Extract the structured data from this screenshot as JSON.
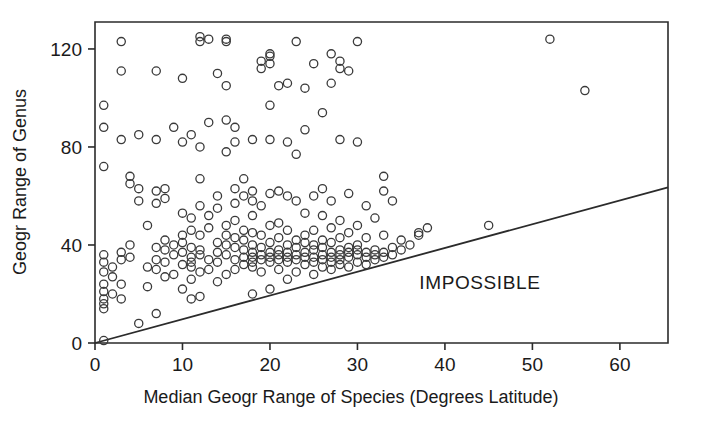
{
  "chart_data": {
    "type": "scatter",
    "title": "",
    "xlabel": "Median Geogr Range of Species (Degrees Latitude)",
    "ylabel": "Geogr Range of Genus",
    "xlim": [
      0,
      65.5
    ],
    "ylim": [
      0,
      131
    ],
    "xticks": [
      0,
      10,
      20,
      30,
      40,
      50,
      60
    ],
    "xtick_labels": [
      "0",
      "10",
      "20",
      "30",
      "40",
      "50",
      "60"
    ],
    "yticks": [
      0,
      40,
      80,
      120
    ],
    "ytick_labels": [
      "0",
      "40",
      "80",
      "120"
    ],
    "grid": false,
    "legend": null,
    "annotations": [
      {
        "text": "IMPOSSIBLE",
        "x": 44,
        "y": 22,
        "name": "impossible-region-label"
      }
    ],
    "reference_line": {
      "name": "identity-boundary-line",
      "description": "Lower bound: genus range cannot be less than median species range",
      "x0": 0,
      "y0": 0,
      "x1": 65.5,
      "y1": 63.5
    },
    "marker": {
      "shape": "open-circle",
      "size": 6,
      "edge_color": "#3a3a3a",
      "fill": "none"
    },
    "points": [
      [
        1,
        1
      ],
      [
        1,
        14
      ],
      [
        1,
        16
      ],
      [
        1,
        18
      ],
      [
        1,
        21
      ],
      [
        1,
        24
      ],
      [
        1,
        29
      ],
      [
        1,
        33
      ],
      [
        1,
        36
      ],
      [
        1,
        72
      ],
      [
        1,
        88
      ],
      [
        1,
        97
      ],
      [
        2,
        20
      ],
      [
        2,
        27
      ],
      [
        2,
        31
      ],
      [
        3,
        18
      ],
      [
        3,
        24
      ],
      [
        3,
        34
      ],
      [
        3,
        37
      ],
      [
        3,
        83
      ],
      [
        3,
        111
      ],
      [
        3,
        123
      ],
      [
        4,
        35
      ],
      [
        4,
        40
      ],
      [
        4,
        65
      ],
      [
        4,
        68
      ],
      [
        5,
        8
      ],
      [
        5,
        58
      ],
      [
        5,
        63
      ],
      [
        5,
        85
      ],
      [
        6,
        23
      ],
      [
        6,
        31
      ],
      [
        6,
        48
      ],
      [
        7,
        12
      ],
      [
        7,
        30
      ],
      [
        7,
        34
      ],
      [
        7,
        39
      ],
      [
        7,
        57
      ],
      [
        7,
        62
      ],
      [
        7,
        83
      ],
      [
        7,
        111
      ],
      [
        8,
        27
      ],
      [
        8,
        33
      ],
      [
        8,
        38
      ],
      [
        8,
        42
      ],
      [
        8,
        59
      ],
      [
        8,
        63
      ],
      [
        9,
        28
      ],
      [
        9,
        36
      ],
      [
        9,
        40
      ],
      [
        9,
        88
      ],
      [
        10,
        22
      ],
      [
        10,
        32
      ],
      [
        10,
        37
      ],
      [
        10,
        41
      ],
      [
        10,
        44
      ],
      [
        10,
        53
      ],
      [
        10,
        82
      ],
      [
        10,
        108
      ],
      [
        11,
        18
      ],
      [
        11,
        26
      ],
      [
        11,
        31
      ],
      [
        11,
        33
      ],
      [
        11,
        35
      ],
      [
        11,
        39
      ],
      [
        11,
        46
      ],
      [
        11,
        51
      ],
      [
        11,
        85
      ],
      [
        12,
        19
      ],
      [
        12,
        29
      ],
      [
        12,
        36
      ],
      [
        12,
        38
      ],
      [
        12,
        44
      ],
      [
        12,
        56
      ],
      [
        12,
        67
      ],
      [
        12,
        80
      ],
      [
        12,
        123
      ],
      [
        12,
        125
      ],
      [
        13,
        30
      ],
      [
        13,
        34
      ],
      [
        13,
        47
      ],
      [
        13,
        52
      ],
      [
        13,
        90
      ],
      [
        13,
        124
      ],
      [
        14,
        25
      ],
      [
        14,
        33
      ],
      [
        14,
        37
      ],
      [
        14,
        41
      ],
      [
        14,
        55
      ],
      [
        14,
        60
      ],
      [
        14,
        110
      ],
      [
        15,
        28
      ],
      [
        15,
        36
      ],
      [
        15,
        40
      ],
      [
        15,
        44
      ],
      [
        15,
        48
      ],
      [
        15,
        78
      ],
      [
        15,
        91
      ],
      [
        15,
        105
      ],
      [
        15,
        123
      ],
      [
        15,
        124
      ],
      [
        16,
        30
      ],
      [
        16,
        34
      ],
      [
        16,
        39
      ],
      [
        16,
        43
      ],
      [
        16,
        50
      ],
      [
        16,
        57
      ],
      [
        16,
        63
      ],
      [
        16,
        82
      ],
      [
        16,
        88
      ],
      [
        17,
        32
      ],
      [
        17,
        35
      ],
      [
        17,
        38
      ],
      [
        17,
        42
      ],
      [
        17,
        46
      ],
      [
        17,
        60
      ],
      [
        17,
        67
      ],
      [
        18,
        20
      ],
      [
        18,
        31
      ],
      [
        18,
        33
      ],
      [
        18,
        35
      ],
      [
        18,
        37
      ],
      [
        18,
        40
      ],
      [
        18,
        45
      ],
      [
        18,
        52
      ],
      [
        18,
        58
      ],
      [
        18,
        62
      ],
      [
        18,
        83
      ],
      [
        19,
        29
      ],
      [
        19,
        34
      ],
      [
        19,
        36
      ],
      [
        19,
        39
      ],
      [
        19,
        44
      ],
      [
        19,
        56
      ],
      [
        19,
        112
      ],
      [
        19,
        115
      ],
      [
        20,
        22
      ],
      [
        20,
        33
      ],
      [
        20,
        35
      ],
      [
        20,
        37
      ],
      [
        20,
        41
      ],
      [
        20,
        48
      ],
      [
        20,
        61
      ],
      [
        20,
        83
      ],
      [
        20,
        97
      ],
      [
        20,
        114
      ],
      [
        20,
        117
      ],
      [
        20,
        118
      ],
      [
        21,
        30
      ],
      [
        21,
        34
      ],
      [
        21,
        36
      ],
      [
        21,
        38
      ],
      [
        21,
        43
      ],
      [
        21,
        49
      ],
      [
        21,
        62
      ],
      [
        21,
        105
      ],
      [
        22,
        26
      ],
      [
        22,
        33
      ],
      [
        22,
        35
      ],
      [
        22,
        37
      ],
      [
        22,
        40
      ],
      [
        22,
        46
      ],
      [
        22,
        60
      ],
      [
        22,
        82
      ],
      [
        22,
        106
      ],
      [
        23,
        29
      ],
      [
        23,
        34
      ],
      [
        23,
        36
      ],
      [
        23,
        39
      ],
      [
        23,
        42
      ],
      [
        23,
        58
      ],
      [
        23,
        77
      ],
      [
        23,
        123
      ],
      [
        24,
        32
      ],
      [
        24,
        35
      ],
      [
        24,
        37
      ],
      [
        24,
        41
      ],
      [
        24,
        44
      ],
      [
        24,
        53
      ],
      [
        24,
        87
      ],
      [
        24,
        104
      ],
      [
        25,
        28
      ],
      [
        25,
        33
      ],
      [
        25,
        35
      ],
      [
        25,
        38
      ],
      [
        25,
        40
      ],
      [
        25,
        46
      ],
      [
        25,
        60
      ],
      [
        25,
        114
      ],
      [
        26,
        31
      ],
      [
        26,
        34
      ],
      [
        26,
        36
      ],
      [
        26,
        39
      ],
      [
        26,
        42
      ],
      [
        26,
        52
      ],
      [
        26,
        63
      ],
      [
        26,
        94
      ],
      [
        27,
        30
      ],
      [
        27,
        33
      ],
      [
        27,
        35
      ],
      [
        27,
        37
      ],
      [
        27,
        41
      ],
      [
        27,
        47
      ],
      [
        27,
        58
      ],
      [
        27,
        106
      ],
      [
        27,
        118
      ],
      [
        28,
        32
      ],
      [
        28,
        34
      ],
      [
        28,
        36
      ],
      [
        28,
        38
      ],
      [
        28,
        43
      ],
      [
        28,
        50
      ],
      [
        28,
        83
      ],
      [
        28,
        112
      ],
      [
        28,
        115
      ],
      [
        29,
        31
      ],
      [
        29,
        35
      ],
      [
        29,
        37
      ],
      [
        29,
        39
      ],
      [
        29,
        45
      ],
      [
        29,
        61
      ],
      [
        29,
        111
      ],
      [
        30,
        33
      ],
      [
        30,
        36
      ],
      [
        30,
        38
      ],
      [
        30,
        40
      ],
      [
        30,
        48
      ],
      [
        30,
        82
      ],
      [
        30,
        123
      ],
      [
        31,
        32
      ],
      [
        31,
        35
      ],
      [
        31,
        37
      ],
      [
        31,
        43
      ],
      [
        31,
        56
      ],
      [
        32,
        34
      ],
      [
        32,
        36
      ],
      [
        32,
        38
      ],
      [
        32,
        51
      ],
      [
        33,
        35
      ],
      [
        33,
        37
      ],
      [
        33,
        44
      ],
      [
        33,
        62
      ],
      [
        33,
        68
      ],
      [
        34,
        36
      ],
      [
        34,
        39
      ],
      [
        34,
        58
      ],
      [
        35,
        38
      ],
      [
        35,
        42
      ],
      [
        36,
        40
      ],
      [
        37,
        44
      ],
      [
        37,
        45
      ],
      [
        38,
        47
      ],
      [
        45,
        48
      ],
      [
        52,
        124
      ],
      [
        56,
        103
      ]
    ]
  },
  "axis": {
    "x_title": "Median Geogr Range of Species (Degrees Latitude)",
    "y_title": "Geogr Range of Genus"
  }
}
